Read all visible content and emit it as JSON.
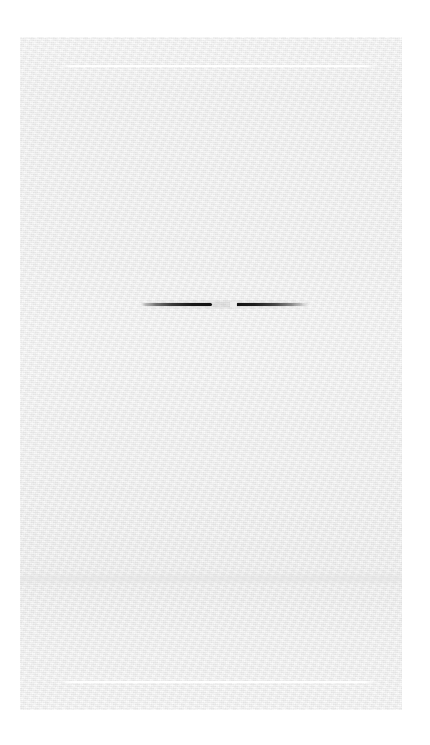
{
  "document": {
    "title": "",
    "visible_text": "",
    "body_text": "",
    "status_text": "",
    "page_label": "",
    "appearance": "near-blank light gray scanned page with faint paper grain"
  },
  "canvas": {
    "width": 430,
    "height": 745,
    "background_color": "#ffffff"
  },
  "panel": {
    "background_color": "#ebebeb",
    "left": 20,
    "top": 37,
    "width": 382,
    "height": 673,
    "label": ""
  },
  "marks": {
    "hairline_top": {
      "label": "",
      "color": "#ffffff",
      "left": 58,
      "top": 65,
      "width": 320,
      "height": 2
    },
    "hairline_bottom": {
      "label": "",
      "color": "#ffffff",
      "left": 58,
      "top": 681,
      "width": 320,
      "height": 2
    },
    "tonal_band": {
      "label": "",
      "color": "#e2e2e2",
      "top": 573,
      "height": 12
    },
    "ink_stroke": {
      "label": "",
      "color": "#111111",
      "left": 141,
      "top": 308,
      "width": 147,
      "thickness": 3,
      "segment_count": 2,
      "gap_color": "#eeeeee"
    }
  }
}
